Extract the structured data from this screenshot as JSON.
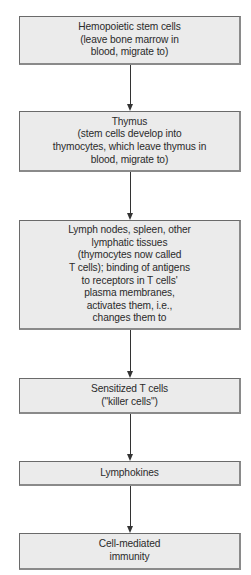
{
  "diagram": {
    "type": "flowchart",
    "direction": "top-to-bottom",
    "colors": {
      "box_fill": "#ebebeb",
      "box_border": "#6a6a6a",
      "text": "#2a2a2a",
      "connector": "#333333"
    },
    "nodes": [
      {
        "id": "n1",
        "text": "Hemopoietic stem cells\n(leave bone marrow in\nblood, migrate to)"
      },
      {
        "id": "n2",
        "text": "Thymus\n(stem cells develop into\nthymocytes, which leave thymus in\nblood, migrate to)"
      },
      {
        "id": "n3",
        "text": "Lymph nodes, spleen, other\nlymphatic tissues\n(thymocytes now called\nT cells); binding of antigens\nto receptors in T cells'\nplasma membranes,\nactivates them, i.e.,\nchanges them to"
      },
      {
        "id": "n4",
        "text": "Sensitized T cells\n(\"killer cells\")"
      },
      {
        "id": "n5",
        "text": "Lymphokines"
      },
      {
        "id": "n6",
        "text": "Cell-mediated\nimmunity"
      }
    ],
    "edges": [
      {
        "from": "n1",
        "to": "n2"
      },
      {
        "from": "n2",
        "to": "n3"
      },
      {
        "from": "n3",
        "to": "n4"
      },
      {
        "from": "n4",
        "to": "n5"
      },
      {
        "from": "n5",
        "to": "n6"
      }
    ]
  }
}
